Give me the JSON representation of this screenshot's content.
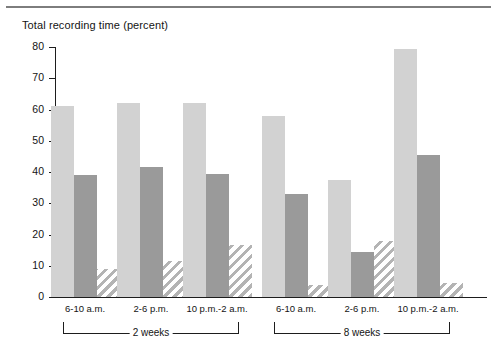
{
  "chart_data": {
    "type": "bar",
    "title": "Total recording time (percent)",
    "xlabel": "",
    "ylabel": "Total recording time (percent)",
    "ylim": [
      0,
      80
    ],
    "yticks": [
      0,
      10,
      20,
      30,
      40,
      50,
      60,
      70,
      80
    ],
    "grid": false,
    "legend_position": "none",
    "categories": [
      "6-10 a.m.",
      "2-6 p.m.",
      "10 p.m.-2 a.m.",
      "6-10 a.m.",
      "2-6 p.m.",
      "10 p.m.-2 a.m."
    ],
    "groups": [
      {
        "label": "2 weeks",
        "categories": [
          "6-10 a.m.",
          "2-6 p.m.",
          "10 p.m.-2 a.m."
        ]
      },
      {
        "label": "8 weeks",
        "categories": [
          "6-10 a.m.",
          "2-6 p.m.",
          "10 p.m.-2 a.m."
        ]
      }
    ],
    "series": [
      {
        "name": "light-gray",
        "style": "solid-light",
        "color": "#d2d2d2",
        "values": [
          61,
          62,
          62,
          58,
          37.5,
          79.5
        ]
      },
      {
        "name": "dark-gray",
        "style": "solid-dark",
        "color": "#9a9a9a",
        "values": [
          39,
          41.5,
          39.5,
          33,
          14.5,
          45.5
        ]
      },
      {
        "name": "hatched",
        "style": "diagonal-hatch",
        "color": "#b4b4b4",
        "values": [
          9,
          11.5,
          16.5,
          4,
          18,
          4.5
        ]
      }
    ]
  },
  "colors": {
    "light_bar": "#d2d2d2",
    "dark_bar": "#9a9a9a",
    "hatch_bar": "#b4b4b4",
    "axis": "#1d1d1d",
    "rule": "#7d7d7d",
    "background": "#ffffff"
  }
}
